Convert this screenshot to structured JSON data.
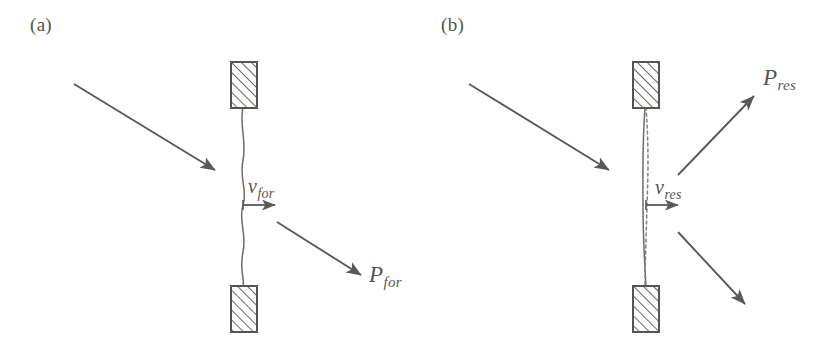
{
  "figure": {
    "caption_kind": "two-panel-physics-diagram",
    "background_color": "#ffffff",
    "ink_color": "#5a5955",
    "width": 827,
    "height": 339
  },
  "panels": [
    {
      "id": "a",
      "label": "(a)",
      "label_position": {
        "x": 30,
        "y": 14
      },
      "string": {
        "kind": "wavy-curve",
        "style": "solid",
        "description": "gently undulating string between two hatched clamps",
        "top_anchor": {
          "x": 243,
          "y": 107
        },
        "bottom_anchor": {
          "x": 243,
          "y": 287
        }
      },
      "clamps": [
        {
          "name": "top-clamp",
          "x": 231,
          "y": 62,
          "width": 26,
          "height": 46,
          "hatch": "diagonal-45"
        },
        {
          "name": "bottom-clamp",
          "x": 231,
          "y": 286,
          "width": 26,
          "height": 46,
          "hatch": "diagonal-45"
        }
      ],
      "arrows": [
        {
          "name": "incoming-excitation-arrow",
          "from": {
            "x": 74,
            "y": 84
          },
          "to": {
            "x": 219,
            "y": 172
          },
          "label": ""
        },
        {
          "name": "velocity-arrow",
          "from": {
            "x": 243,
            "y": 205
          },
          "to": {
            "x": 279,
            "y": 205
          },
          "label": "v_for"
        },
        {
          "name": "outgoing-radiation-arrow",
          "from": {
            "x": 277,
            "y": 222
          },
          "to": {
            "x": 364,
            "y": 277
          },
          "label": "P_for"
        }
      ],
      "labels": [
        {
          "name": "velocity-label",
          "base": "v",
          "sub": "for",
          "x": 248,
          "y": 176
        },
        {
          "name": "power-label",
          "base": "P",
          "sub": "for",
          "x": 369,
          "y": 263
        }
      ]
    },
    {
      "id": "b",
      "label": "(b)",
      "label_position": {
        "x": 441,
        "y": 14
      },
      "string": {
        "kind": "taut-line-with-dashed-mode",
        "style": "solid-plus-dashed",
        "description": "nearly straight string with dashed resonant mode shape alongside",
        "top_anchor": {
          "x": 645,
          "y": 107
        },
        "bottom_anchor": {
          "x": 645,
          "y": 287
        }
      },
      "clamps": [
        {
          "name": "top-clamp",
          "x": 633,
          "y": 62,
          "width": 26,
          "height": 46,
          "hatch": "diagonal-45"
        },
        {
          "name": "bottom-clamp",
          "x": 633,
          "y": 286,
          "width": 26,
          "height": 46,
          "hatch": "diagonal-45"
        }
      ],
      "arrows": [
        {
          "name": "incoming-excitation-arrow",
          "from": {
            "x": 469,
            "y": 84
          },
          "to": {
            "x": 613,
            "y": 172
          },
          "label": ""
        },
        {
          "name": "velocity-arrow",
          "from": {
            "x": 646,
            "y": 205
          },
          "to": {
            "x": 682,
            "y": 205
          },
          "label": "v_res"
        },
        {
          "name": "outgoing-radiation-arrow-upper",
          "from": {
            "x": 678,
            "y": 175
          },
          "to": {
            "x": 757,
            "y": 93
          },
          "label": "P_res"
        },
        {
          "name": "outgoing-radiation-arrow-lower",
          "from": {
            "x": 678,
            "y": 232
          },
          "to": {
            "x": 748,
            "y": 307
          },
          "label": ""
        }
      ],
      "labels": [
        {
          "name": "velocity-label",
          "base": "v",
          "sub": "res",
          "x": 655,
          "y": 177
        },
        {
          "name": "power-label",
          "base": "P",
          "sub": "res",
          "x": 763,
          "y": 66
        }
      ]
    }
  ],
  "text": {
    "panel_a_label": "(a)",
    "panel_b_label": "(b)",
    "v_for_base": "v",
    "v_for_sub": "for",
    "p_for_base": "P",
    "p_for_sub": "for",
    "v_res_base": "v",
    "v_res_sub": "res",
    "p_res_base": "P",
    "p_res_sub": "res"
  },
  "colors": {
    "ink": "#5a5955",
    "ink_light": "#84837d",
    "hatch": "#6d6c66",
    "paper": "#ffffff"
  }
}
